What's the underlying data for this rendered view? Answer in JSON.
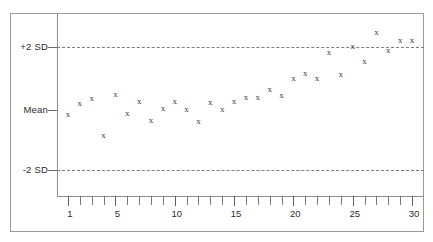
{
  "chart_data": {
    "type": "scatter",
    "title": "",
    "subtitle": "",
    "xlabel": "",
    "ylabel": "",
    "grid": false,
    "legend": "none",
    "marker_symbol": "x",
    "xlim": [
      0.4,
      30.6
    ],
    "ylim": [
      -3,
      3
    ],
    "x_tick_interval": 1,
    "x_tick_labels": [
      "1",
      "5",
      "10",
      "15",
      "20",
      "25",
      "30"
    ],
    "x_tick_label_values": [
      1,
      5,
      10,
      15,
      20,
      25,
      30
    ],
    "x_all_ticks": [
      1,
      2,
      3,
      4,
      5,
      6,
      7,
      8,
      9,
      10,
      11,
      12,
      13,
      14,
      15,
      16,
      17,
      18,
      19,
      20,
      21,
      22,
      23,
      24,
      25,
      26,
      27,
      28,
      29,
      30
    ],
    "y_tick_labels": [
      "+2 SD",
      "Mean",
      "-2 SD"
    ],
    "y_tick_values": [
      2,
      0,
      -2
    ],
    "reference_lines": [
      {
        "label": "+2 SD",
        "value": 2,
        "style": "dashed"
      },
      {
        "label": "Mean",
        "value": 0,
        "style": "tick-only"
      },
      {
        "label": "-2 SD",
        "value": -2,
        "style": "dashed"
      }
    ],
    "x": [
      1,
      2,
      3,
      4,
      5,
      6,
      7,
      8,
      9,
      10,
      11,
      12,
      13,
      14,
      15,
      16,
      17,
      18,
      19,
      20,
      21,
      22,
      23,
      24,
      25,
      26,
      27,
      28,
      29,
      30
    ],
    "values": [
      -0.12,
      0.22,
      0.38,
      -0.78,
      0.5,
      -0.1,
      0.28,
      -0.33,
      0.06,
      0.27,
      0.02,
      -0.35,
      0.25,
      0.04,
      0.28,
      0.42,
      0.4,
      0.68,
      0.48,
      1.02,
      1.18,
      1.02,
      1.85,
      1.15,
      2.02,
      1.55,
      2.48,
      1.92,
      2.22,
      2.22
    ],
    "series": [
      {
        "name": "QC measurement",
        "values": [
          -0.12,
          0.22,
          0.38,
          -0.78,
          0.5,
          -0.1,
          0.28,
          -0.33,
          0.06,
          0.27,
          0.02,
          -0.35,
          0.25,
          0.04,
          0.28,
          0.42,
          0.4,
          0.68,
          0.48,
          1.02,
          1.18,
          1.02,
          1.85,
          1.15,
          2.02,
          1.55,
          2.48,
          1.92,
          2.22,
          2.22
        ]
      }
    ],
    "n_points": 30,
    "colors": {
      "marker": "#3a3a3a",
      "axis": "#8e8e8e",
      "reference_line": "#7d7d7d",
      "frame": "#9a9a9a",
      "text": "#2b2b2b",
      "background": "#ffffff"
    }
  }
}
